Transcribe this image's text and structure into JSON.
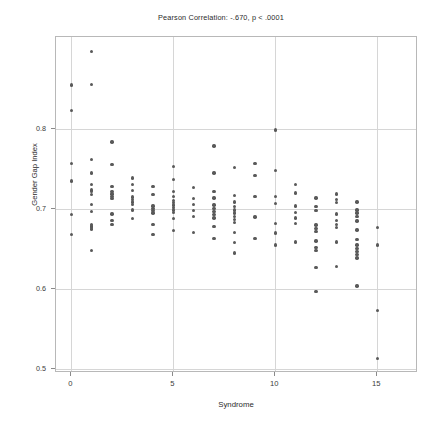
{
  "chart_data": {
    "type": "scatter",
    "title": "Pearson Correlation: -.670, p < .0001",
    "xlabel": "Syndrome",
    "ylabel": "Gender Gap Index",
    "xlim": [
      -0.75,
      17.0
    ],
    "ylim": [
      0.495,
      0.915
    ],
    "xticks": [
      0,
      5,
      10,
      15
    ],
    "xtick_labels": [
      "0",
      "5",
      "10",
      "15"
    ],
    "yticks": [
      0.5,
      0.6,
      0.7,
      0.8
    ],
    "ytick_labels": [
      "0.5",
      "0.6",
      "0.7",
      "0.8"
    ],
    "grid": true,
    "legend": null,
    "correlation": -0.67,
    "p_value": "< .0001",
    "marker_color": "#595959",
    "marker_size": 3.4,
    "points": [
      [
        0,
        0.855
      ],
      [
        0,
        0.823
      ],
      [
        0,
        0.757
      ],
      [
        0,
        0.735
      ],
      [
        0,
        0.693
      ],
      [
        0,
        0.668
      ],
      [
        1,
        0.897
      ],
      [
        1,
        0.856
      ],
      [
        1,
        0.762
      ],
      [
        1,
        0.745
      ],
      [
        1,
        0.731
      ],
      [
        1,
        0.724
      ],
      [
        1,
        0.722
      ],
      [
        1,
        0.718
      ],
      [
        1,
        0.706
      ],
      [
        1,
        0.697
      ],
      [
        1,
        0.681
      ],
      [
        1,
        0.679
      ],
      [
        1,
        0.677
      ],
      [
        1,
        0.675
      ],
      [
        1,
        0.648
      ],
      [
        2,
        0.784
      ],
      [
        2,
        0.756
      ],
      [
        2,
        0.728
      ],
      [
        2,
        0.722
      ],
      [
        2,
        0.719
      ],
      [
        2,
        0.716
      ],
      [
        2,
        0.713
      ],
      [
        2,
        0.694
      ],
      [
        2,
        0.686
      ],
      [
        2,
        0.681
      ],
      [
        3,
        0.739
      ],
      [
        3,
        0.731
      ],
      [
        3,
        0.723
      ],
      [
        3,
        0.715
      ],
      [
        3,
        0.712
      ],
      [
        3,
        0.709
      ],
      [
        3,
        0.706
      ],
      [
        3,
        0.699
      ],
      [
        3,
        0.688
      ],
      [
        4,
        0.728
      ],
      [
        4,
        0.718
      ],
      [
        4,
        0.704
      ],
      [
        4,
        0.701
      ],
      [
        4,
        0.698
      ],
      [
        4,
        0.695
      ],
      [
        4,
        0.681
      ],
      [
        4,
        0.668
      ],
      [
        5,
        0.753
      ],
      [
        5,
        0.737
      ],
      [
        5,
        0.722
      ],
      [
        5,
        0.716
      ],
      [
        5,
        0.711
      ],
      [
        5,
        0.708
      ],
      [
        5,
        0.705
      ],
      [
        5,
        0.702
      ],
      [
        5,
        0.699
      ],
      [
        5,
        0.696
      ],
      [
        5,
        0.688
      ],
      [
        5,
        0.673
      ],
      [
        6,
        0.727
      ],
      [
        6,
        0.713
      ],
      [
        6,
        0.706
      ],
      [
        6,
        0.698
      ],
      [
        6,
        0.691
      ],
      [
        6,
        0.671
      ],
      [
        7,
        0.779
      ],
      [
        7,
        0.745
      ],
      [
        7,
        0.722
      ],
      [
        7,
        0.714
      ],
      [
        7,
        0.705
      ],
      [
        7,
        0.701
      ],
      [
        7,
        0.697
      ],
      [
        7,
        0.693
      ],
      [
        7,
        0.689
      ],
      [
        7,
        0.678
      ],
      [
        7,
        0.663
      ],
      [
        8,
        0.752
      ],
      [
        8,
        0.717
      ],
      [
        8,
        0.709
      ],
      [
        8,
        0.703
      ],
      [
        8,
        0.699
      ],
      [
        8,
        0.695
      ],
      [
        8,
        0.691
      ],
      [
        8,
        0.687
      ],
      [
        8,
        0.683
      ],
      [
        8,
        0.671
      ],
      [
        8,
        0.658
      ],
      [
        8,
        0.645
      ],
      [
        9,
        0.757
      ],
      [
        9,
        0.742
      ],
      [
        9,
        0.716
      ],
      [
        9,
        0.69
      ],
      [
        9,
        0.663
      ],
      [
        10,
        0.799
      ],
      [
        10,
        0.748
      ],
      [
        10,
        0.716
      ],
      [
        10,
        0.707
      ],
      [
        10,
        0.682
      ],
      [
        10,
        0.67
      ],
      [
        10,
        0.655
      ],
      [
        11,
        0.731
      ],
      [
        11,
        0.72
      ],
      [
        11,
        0.704
      ],
      [
        11,
        0.696
      ],
      [
        11,
        0.689
      ],
      [
        11,
        0.682
      ],
      [
        11,
        0.659
      ],
      [
        12,
        0.714
      ],
      [
        12,
        0.703
      ],
      [
        12,
        0.698
      ],
      [
        12,
        0.68
      ],
      [
        12,
        0.676
      ],
      [
        12,
        0.672
      ],
      [
        12,
        0.66
      ],
      [
        12,
        0.652
      ],
      [
        12,
        0.648
      ],
      [
        12,
        0.627
      ],
      [
        12,
        0.597
      ],
      [
        13,
        0.719
      ],
      [
        13,
        0.712
      ],
      [
        13,
        0.708
      ],
      [
        13,
        0.694
      ],
      [
        13,
        0.686
      ],
      [
        13,
        0.681
      ],
      [
        13,
        0.677
      ],
      [
        13,
        0.659
      ],
      [
        13,
        0.628
      ],
      [
        14,
        0.709
      ],
      [
        14,
        0.699
      ],
      [
        14,
        0.695
      ],
      [
        14,
        0.691
      ],
      [
        14,
        0.685
      ],
      [
        14,
        0.674
      ],
      [
        14,
        0.662
      ],
      [
        14,
        0.655
      ],
      [
        14,
        0.651
      ],
      [
        14,
        0.647
      ],
      [
        14,
        0.643
      ],
      [
        14,
        0.639
      ],
      [
        14,
        0.604
      ],
      [
        15,
        0.677
      ],
      [
        15,
        0.655
      ],
      [
        15,
        0.573
      ],
      [
        15,
        0.513
      ]
    ]
  }
}
